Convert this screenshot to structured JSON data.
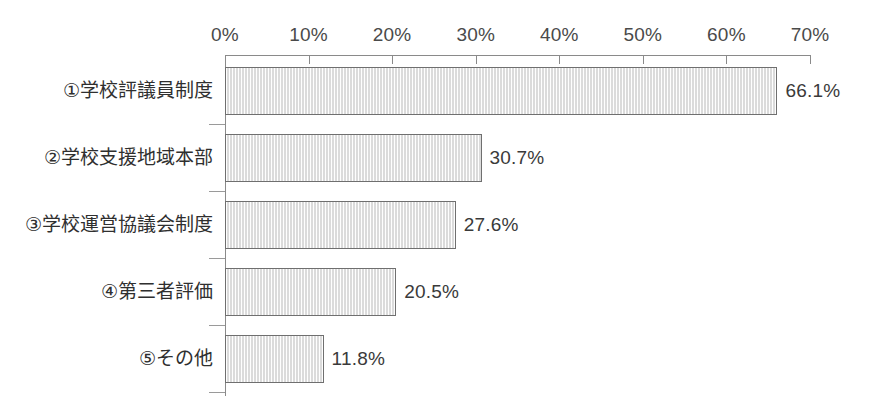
{
  "chart_data": {
    "type": "bar",
    "orientation": "horizontal",
    "title": "",
    "subtitle": "",
    "xlabel": "",
    "ylabel": "",
    "categories": [
      "①学校評議員制度",
      "②学校支援地域本部",
      "③学校運営協議会制度",
      "④第三者評価",
      "⑤その他"
    ],
    "values": [
      66.1,
      30.7,
      27.6,
      20.5,
      11.8
    ],
    "value_labels": [
      "66.1%",
      "30.7%",
      "27.6%",
      "20.5%",
      "11.8%"
    ],
    "xlim": [
      0,
      70
    ],
    "xticks": [
      0,
      10,
      20,
      30,
      40,
      50,
      60,
      70
    ],
    "xtick_labels": [
      "0%",
      "10%",
      "20%",
      "30%",
      "40%",
      "50%",
      "60%",
      "70%"
    ],
    "xaxis_position": "top",
    "grid": false,
    "legend": false,
    "bar_fill_color": "#ececec",
    "bar_border_color": "#6f6f6f",
    "axis_color": "#8a8a8a",
    "text_color": "#3a3a3a",
    "background_color": "#ffffff"
  }
}
